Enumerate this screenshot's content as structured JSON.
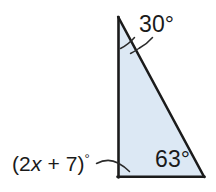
{
  "figure": {
    "kind": "geometry-diagram",
    "shape": "triangle",
    "fill_color": "#dce8f4",
    "stroke_color": "#1b1b1b",
    "background_color": "#ffffff",
    "text_color": "#1a1a1a",
    "vertices": {
      "apex": {
        "x": 118,
        "y": 17
      },
      "bottom_left": {
        "x": 118,
        "y": 177
      },
      "bottom_right": {
        "x": 204,
        "y": 177
      }
    }
  },
  "labels": {
    "apex_angle": "30°",
    "bottom_right_angle": "63°",
    "bottom_left_angle_prefix": "(2",
    "bottom_left_angle_var": "x",
    "bottom_left_angle_suffix": " + 7)",
    "bottom_left_angle_degree": "°",
    "bottom_left_angle_full": "(2x + 7)°"
  },
  "annotations": {
    "apex_arc": "angle-arc-tick",
    "apex_leader": "curved-leader-line",
    "bottom_left_leader": "curved-leader-line"
  }
}
